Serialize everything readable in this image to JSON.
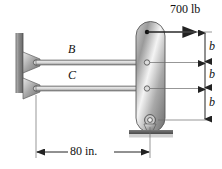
{
  "figure": {
    "background": "#ffffff"
  },
  "labels": {
    "force": "700 lb",
    "bar_upper": "B",
    "bar_lower": "C",
    "dim_b1": "b",
    "dim_b2": "b",
    "dim_b3": "b",
    "span": "80 in."
  },
  "colors": {
    "line": "#333333",
    "metal_light": "#f2f2f2",
    "metal_mid": "#b8b8b8",
    "metal_dark": "#6e6e6e",
    "wall": "#888888",
    "ground": "#5a5a5a",
    "text": "#111111"
  },
  "geometry": {
    "force_y": 32,
    "bar_upper_y": 62,
    "bar_lower_y": 88,
    "base_pin_y": 120,
    "wall_x": 22,
    "plate_x": 136,
    "plate_right": 165,
    "dim_line_x": 205,
    "span_line_y": 152
  }
}
